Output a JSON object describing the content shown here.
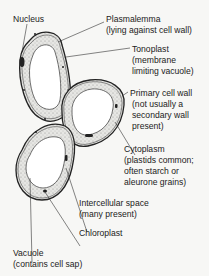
{
  "diagram": {
    "labels": {
      "nucleus": "Nucleus",
      "plasmalemma": "Plasmalemma",
      "plasmalemma_note": "(lying against cell wall)",
      "tonoplast": "Tonoplast",
      "tonoplast_note_1": "(membrane",
      "tonoplast_note_2": "limiting vacuole)",
      "primary_wall": "Primary cell wall",
      "primary_wall_note_1": "(not usually a",
      "primary_wall_note_2": "secondary wall",
      "primary_wall_note_3": "present)",
      "cytoplasm": "Cytoplasm",
      "cytoplasm_note_1": "(plastids common;",
      "cytoplasm_note_2": "often starch or",
      "cytoplasm_note_3": "aleurone grains)",
      "intercellular": "Intercellular space",
      "intercellular_note": "(many present)",
      "chloroplast": "Chloroplast",
      "vacuole": "Vacuole",
      "vacuole_note": "(contains cell sap)"
    },
    "colors": {
      "line": "#222222",
      "cytoplasm_fill": "#d9d9d6",
      "vacuole_fill": "#ffffff",
      "background": "#f7f7f5"
    }
  }
}
